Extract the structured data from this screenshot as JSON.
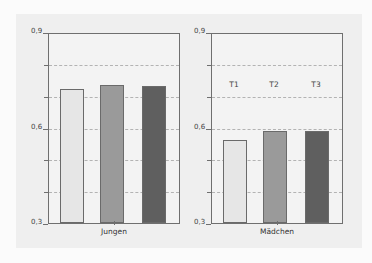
{
  "chart_data": [
    {
      "type": "bar",
      "title": "",
      "xlabel": "Jungen",
      "ylabel": "",
      "categories": [
        "T1",
        "T2",
        "T3"
      ],
      "values": [
        0.72,
        0.735,
        0.73
      ],
      "ylim": [
        0.3,
        0.9
      ],
      "yticks": [
        "0,3",
        "0,6",
        "0,9"
      ],
      "grid": "dashed horizontal every 0.1",
      "colors": [
        "#e6e6e6",
        "#9a9a9a",
        "#5f5f5f"
      ]
    },
    {
      "type": "bar",
      "title": "",
      "xlabel": "Mädchen",
      "ylabel": "",
      "categories": [
        "T1",
        "T2",
        "T3"
      ],
      "values": [
        0.56,
        0.59,
        0.59
      ],
      "ylim": [
        0.3,
        0.9
      ],
      "yticks": [
        "0,3",
        "0,6",
        "0,9"
      ],
      "grid": "dashed horizontal every 0.1",
      "annotations": [
        "T1",
        "T2",
        "T3"
      ],
      "colors": [
        "#e6e6e6",
        "#9a9a9a",
        "#5f5f5f"
      ]
    }
  ],
  "panels": [
    {
      "xlabel": "Jungen",
      "ytick_labels": {
        "top": "0,9",
        "mid": "0,6",
        "bottom": "0,3"
      }
    },
    {
      "xlabel": "Mädchen",
      "ytick_labels": {
        "top": "0,9",
        "mid": "0,6",
        "bottom": "0,3"
      },
      "series_labels": [
        "T1",
        "T2",
        "T3"
      ]
    }
  ]
}
